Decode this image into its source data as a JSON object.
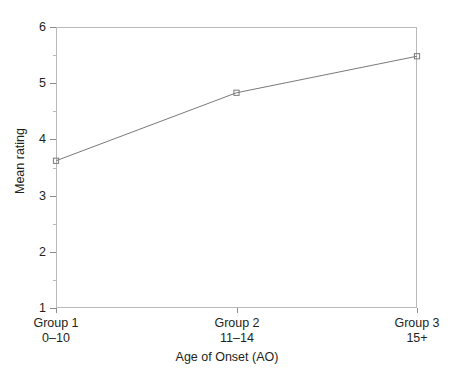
{
  "figure": {
    "clipped_caption_above": "",
    "background": "#ffffff",
    "line_color": "#7a7a7e",
    "marker_color": "#7a7a7e",
    "axis_color": "#b9b9bc",
    "text_color": "#231f20"
  },
  "chart_data": {
    "type": "line",
    "title": "",
    "xlabel": "Age of Onset (AO)",
    "ylabel": "Mean rating",
    "categories": [
      "Group 1\n0–10",
      "Group 2\n11–14",
      "Group 3\n15+"
    ],
    "category_lines": [
      {
        "line1": "Group 1",
        "line2": "0–10"
      },
      {
        "line1": "Group 2",
        "line2": "11–14"
      },
      {
        "line1": "Group 3",
        "line2": "15+"
      }
    ],
    "series": [
      {
        "name": "Mean rating",
        "values": [
          3.62,
          4.83,
          5.48
        ]
      }
    ],
    "values": [
      3.62,
      4.83,
      5.48
    ],
    "ylim": [
      1,
      6
    ],
    "yticks": [
      1,
      2,
      3,
      4,
      5,
      6
    ],
    "ytick_labels": [
      "1",
      "2",
      "3",
      "4",
      "5",
      "6"
    ],
    "yminor_ticks": [
      1.5,
      2.5,
      3.5,
      4.5,
      5.5
    ],
    "grid": false,
    "legend": null,
    "legend_position": "none",
    "marker": "open-square",
    "annotations": []
  },
  "axes": {
    "y_title": "Mean rating",
    "x_title": "Age of Onset (AO)"
  }
}
